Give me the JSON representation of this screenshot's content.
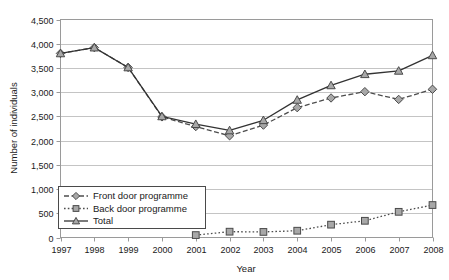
{
  "chart_data": {
    "type": "line",
    "title": "",
    "xlabel": "Year",
    "ylabel": "Number of individuals",
    "categories": [
      1997,
      1998,
      1999,
      2000,
      2001,
      2002,
      2003,
      2004,
      2005,
      2006,
      2007,
      2008
    ],
    "xtick_labels": [
      "1997",
      "1998",
      "1999",
      "2000",
      "2001",
      "2002",
      "2003",
      "2004",
      "2005",
      "2006",
      "2007",
      "2008"
    ],
    "ytick_labels": [
      "0",
      "500",
      "1,000",
      "1,500",
      "2,000",
      "2,500",
      "3,000",
      "3,500",
      "4,000",
      "4,500"
    ],
    "ytick_values": [
      0,
      500,
      1000,
      1500,
      2000,
      2500,
      3000,
      3500,
      4000,
      4500
    ],
    "ylim": [
      0,
      4500
    ],
    "xlim": [
      1997,
      2008
    ],
    "grid": "horizontal",
    "legend_position": "lower-left-inside",
    "series": [
      {
        "name": "Front door programme",
        "marker": "diamond",
        "linestyle": "dashed",
        "color": "#4d4d4d",
        "values": [
          3800,
          3920,
          3510,
          2490,
          2290,
          2100,
          2320,
          2680,
          2880,
          3010,
          2850,
          3060
        ]
      },
      {
        "name": "Back door programme",
        "marker": "square",
        "linestyle": "dotted",
        "color": "#4d4d4d",
        "values": [
          null,
          null,
          null,
          null,
          50,
          120,
          115,
          140,
          265,
          345,
          530,
          670
        ]
      },
      {
        "name": "Total",
        "marker": "triangle",
        "linestyle": "solid",
        "color": "#333333",
        "values": [
          3800,
          3920,
          3510,
          2500,
          2340,
          2210,
          2420,
          2840,
          3140,
          3370,
          3440,
          3760
        ]
      }
    ]
  },
  "legend": {
    "entries": [
      {
        "label": "Front door programme"
      },
      {
        "label": "Back door programme"
      },
      {
        "label": "Total"
      }
    ]
  },
  "colors": {
    "grid": "#c4c4c4",
    "frame": "#9a9a9a",
    "marker_fill": "#a8a8a8",
    "marker_stroke": "#4a4a4a",
    "text": "#1a1a1a"
  }
}
